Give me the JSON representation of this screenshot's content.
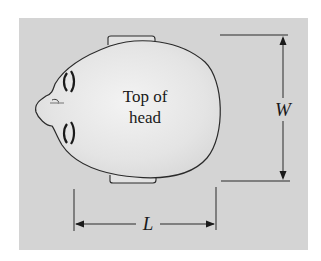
{
  "figure": {
    "head_label_line1": "Top of",
    "head_label_line2": "head",
    "width_label": "W",
    "length_label": "L"
  },
  "colors": {
    "background": "#ffffff",
    "panel": "#d4d4d4",
    "head_fill": "#e6e6e6",
    "head_highlight": "#f2f2f2",
    "outline": "#2a2a2a"
  }
}
